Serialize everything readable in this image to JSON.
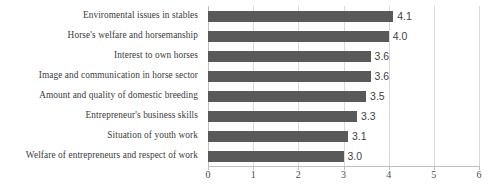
{
  "chart_data": {
    "type": "bar",
    "orientation": "horizontal",
    "title": "",
    "subtitle": "",
    "xlabel": "",
    "ylabel": "",
    "xlim": [
      0,
      6
    ],
    "grid": true,
    "legend": false,
    "x_ticks": [
      "0",
      "1",
      "2",
      "3",
      "4",
      "5",
      "6"
    ],
    "x_tick_values": [
      0,
      1,
      2,
      3,
      4,
      5,
      6
    ],
    "categories": [
      "Enviromental issues in stables",
      "Horse's welfare and horsemanship",
      "Interest to own horses",
      "Image and communication in horse sector",
      "Amount and quality of domestic breeding",
      "Entrepreneur's business skills",
      "Situation of youth work",
      "Welfare of entrepreneurs and respect of work"
    ],
    "values": [
      4.1,
      4.0,
      3.6,
      3.6,
      3.5,
      3.3,
      3.1,
      3.0
    ],
    "value_labels": [
      "4.1",
      "4.0",
      "3.6",
      "3.6",
      "3.5",
      "3.3",
      "3.1",
      "3.0"
    ],
    "bar_color": "#595959",
    "gridline_color": "#d9d9d9",
    "axis_color": "#bfbfbf",
    "background_color": "#ffffff"
  }
}
